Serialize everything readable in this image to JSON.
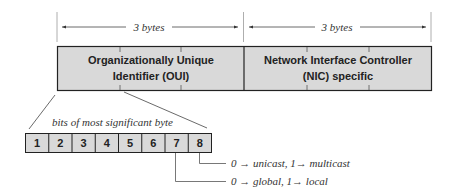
{
  "diagram": {
    "colors": {
      "fill": "#d9d9d9",
      "stroke": "#222222",
      "guide": "#888888",
      "text": "#222222"
    },
    "dimensions": [
      {
        "label": "3 bytes"
      },
      {
        "label": "3 bytes"
      }
    ],
    "fields": [
      {
        "line1": "Organizationally Unique",
        "line2": "Identifier (OUI)"
      },
      {
        "line1": "Network Interface Controller",
        "line2": "(NIC) specific"
      }
    ],
    "bits_caption": "bits of most significant byte",
    "bits": [
      "1",
      "2",
      "3",
      "4",
      "5",
      "6",
      "7",
      "8"
    ],
    "annotations": [
      {
        "bit": "8",
        "text": "0 → unicast,  1→ multicast"
      },
      {
        "bit": "7",
        "text": "0 → global,  1→ local"
      }
    ]
  }
}
